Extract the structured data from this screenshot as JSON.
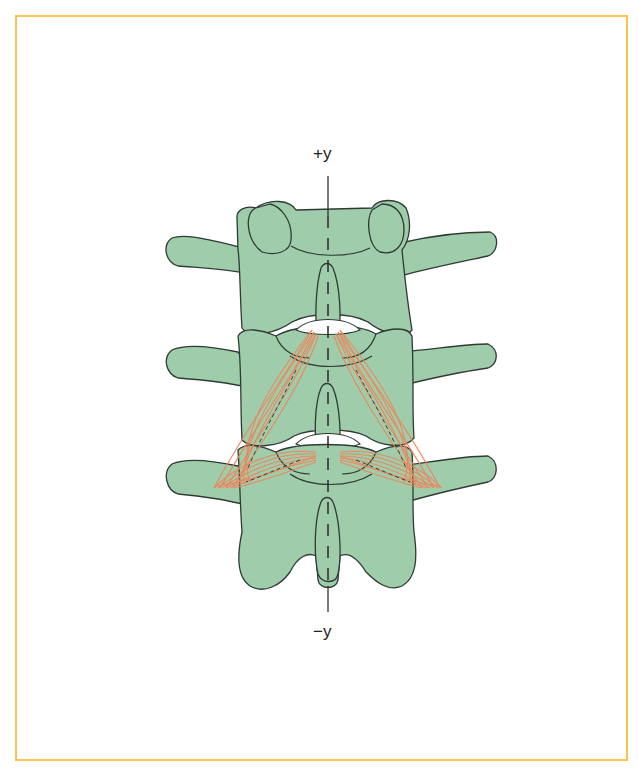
{
  "figure": {
    "type": "anatomical-diagram",
    "axis": {
      "top_label": "+y",
      "bottom_label": "−y",
      "style": "dashed-midline"
    },
    "vertebrae_count": 3,
    "fiber_groups": 4,
    "colors": {
      "frame": "#f5c451",
      "bone_fill": "#9fcdac",
      "bone_stroke": "#2f3a33",
      "fiber": "#ef8458",
      "axis": "#333333"
    }
  }
}
